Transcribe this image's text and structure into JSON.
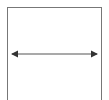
{
  "diagram": {
    "frame": {
      "stroke": "#777777"
    },
    "arrow": {
      "type": "double-headed-horizontal",
      "x1": 11,
      "x2": 98,
      "y": 54,
      "stroke": "#555555"
    }
  }
}
